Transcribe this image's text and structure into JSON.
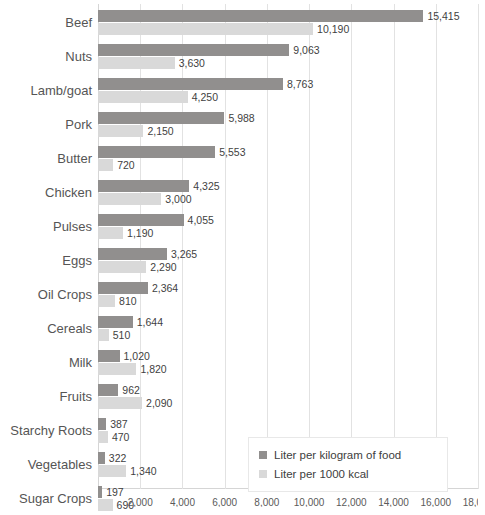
{
  "chart_data": {
    "type": "bar",
    "orientation": "horizontal",
    "title": "",
    "subtitle": "",
    "xlabel": "",
    "ylabel": "",
    "xlim": [
      0,
      18000
    ],
    "grid": true,
    "legend_position": "bottom-right",
    "categories": [
      "Beef",
      "Nuts",
      "Lamb/goat",
      "Pork",
      "Butter",
      "Chicken",
      "Pulses",
      "Eggs",
      "Oil Crops",
      "Cereals",
      "Milk",
      "Fruits",
      "Starchy Roots",
      "Vegetables",
      "Sugar Crops"
    ],
    "series": [
      {
        "name": "Liter per kilogram of food",
        "color": "#918f8e",
        "values": [
          15415,
          9063,
          8763,
          5988,
          5553,
          4325,
          4055,
          3265,
          2364,
          1644,
          1020,
          962,
          387,
          322,
          197
        ],
        "labels": [
          "15,415",
          "9,063",
          "8,763",
          "5,988",
          "5,553",
          "4,325",
          "4,055",
          "3,265",
          "2,364",
          "1,644",
          "1,020",
          "962",
          "387",
          "322",
          "197"
        ]
      },
      {
        "name": "Liter per 1000 kcal",
        "color": "#d9d9d9",
        "values": [
          10190,
          3630,
          4250,
          2150,
          720,
          3000,
          1190,
          2290,
          810,
          510,
          1820,
          2090,
          470,
          1340,
          690
        ],
        "labels": [
          "10,190",
          "3,630",
          "4,250",
          "2,150",
          "720",
          "3,000",
          "1,190",
          "2,290",
          "810",
          "510",
          "1,820",
          "2,090",
          "470",
          "1,340",
          "690"
        ]
      }
    ],
    "xticks": [
      0,
      2000,
      4000,
      6000,
      8000,
      10000,
      12000,
      14000,
      16000,
      18000
    ],
    "xtick_labels": [
      "",
      "2,000",
      "4,000",
      "6,000",
      "8,000",
      "10,000",
      "12,000",
      "14,000",
      "16,000",
      "18,000"
    ]
  },
  "legend": {
    "items": [
      {
        "label": "Liter per kilogram of food",
        "color": "#918f8e"
      },
      {
        "label": "Liter per 1000 kcal",
        "color": "#d9d9d9"
      }
    ]
  }
}
